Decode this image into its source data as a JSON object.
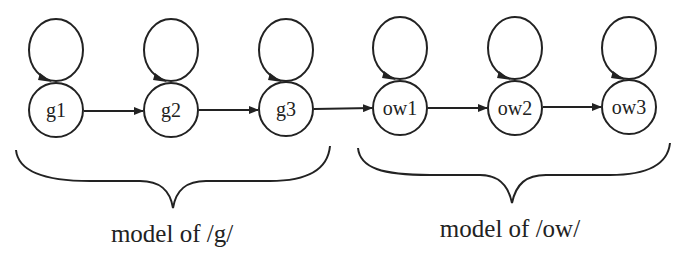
{
  "diagram": {
    "type": "hmm-state-chain",
    "nodes": [
      {
        "id": "g1",
        "label": "g1",
        "cx": 56,
        "cy": 110
      },
      {
        "id": "g2",
        "label": "g2",
        "cx": 171,
        "cy": 110
      },
      {
        "id": "g3",
        "label": "g3",
        "cx": 286,
        "cy": 110
      },
      {
        "id": "ow1",
        "label": "ow1",
        "cx": 400,
        "cy": 110
      },
      {
        "id": "ow2",
        "label": "ow2",
        "cx": 515,
        "cy": 110
      },
      {
        "id": "ow3",
        "label": "ow3",
        "cx": 629,
        "cy": 110
      }
    ],
    "edges": [
      {
        "from": "g1",
        "to": "g2"
      },
      {
        "from": "g2",
        "to": "g3"
      },
      {
        "from": "g3",
        "to": "ow1"
      },
      {
        "from": "ow1",
        "to": "ow2"
      },
      {
        "from": "ow2",
        "to": "ow3"
      }
    ],
    "self_loops": [
      "g1",
      "g2",
      "g3",
      "ow1",
      "ow2",
      "ow3"
    ],
    "groups": [
      {
        "label": "model of /g/",
        "members": [
          "g1",
          "g2",
          "g3"
        ]
      },
      {
        "label": "model of /ow/",
        "members": [
          "ow1",
          "ow2",
          "ow3"
        ]
      }
    ],
    "colors": {
      "stroke": "#222222",
      "background": "#ffffff"
    }
  }
}
